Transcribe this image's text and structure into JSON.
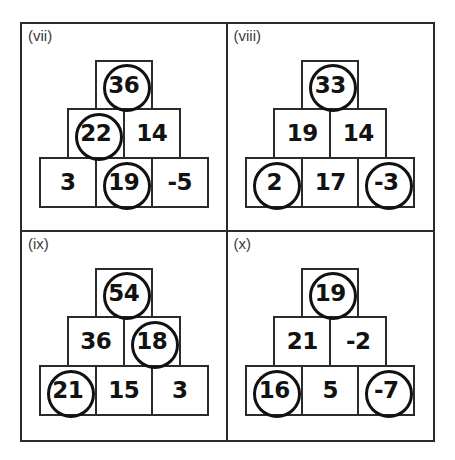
{
  "worksheet": {
    "title": "Number Pyramid Puzzles (vii)-(x)",
    "stroke_color": "#2b2b2b",
    "text_color": "#121212",
    "circle_color": "#111111",
    "background": "#ffffff"
  },
  "panels": [
    {
      "label": "(vii)",
      "name": "panel-vii",
      "rows": [
        {
          "cells": [
            {
              "value": "36",
              "circled": true
            }
          ]
        },
        {
          "cells": [
            {
              "value": "22",
              "circled": true
            },
            {
              "value": "14",
              "circled": false
            }
          ]
        },
        {
          "cells": [
            {
              "value": "3",
              "circled": false
            },
            {
              "value": "19",
              "circled": true
            },
            {
              "value": "-5",
              "circled": false
            }
          ]
        }
      ]
    },
    {
      "label": "(viii)",
      "name": "panel-viii",
      "rows": [
        {
          "cells": [
            {
              "value": "33",
              "circled": true
            }
          ]
        },
        {
          "cells": [
            {
              "value": "19",
              "circled": false
            },
            {
              "value": "14",
              "circled": false
            }
          ]
        },
        {
          "cells": [
            {
              "value": "2",
              "circled": true
            },
            {
              "value": "17",
              "circled": false
            },
            {
              "value": "-3",
              "circled": true
            }
          ]
        }
      ]
    },
    {
      "label": "(ix)",
      "name": "panel-ix",
      "rows": [
        {
          "cells": [
            {
              "value": "54",
              "circled": true
            }
          ]
        },
        {
          "cells": [
            {
              "value": "36",
              "circled": false
            },
            {
              "value": "18",
              "circled": true
            }
          ]
        },
        {
          "cells": [
            {
              "value": "21",
              "circled": true
            },
            {
              "value": "15",
              "circled": false
            },
            {
              "value": "3",
              "circled": false
            }
          ]
        }
      ]
    },
    {
      "label": "(x)",
      "name": "panel-x",
      "rows": [
        {
          "cells": [
            {
              "value": "19",
              "circled": true
            }
          ]
        },
        {
          "cells": [
            {
              "value": "21",
              "circled": false
            },
            {
              "value": "-2",
              "circled": false
            }
          ]
        },
        {
          "cells": [
            {
              "value": "16",
              "circled": true
            },
            {
              "value": "5",
              "circled": false
            },
            {
              "value": "-7",
              "circled": true
            }
          ]
        }
      ]
    }
  ]
}
